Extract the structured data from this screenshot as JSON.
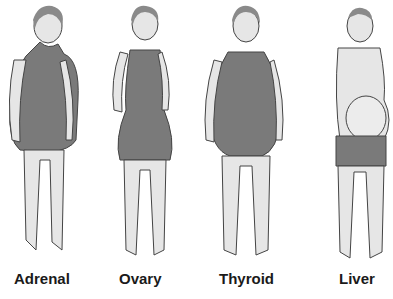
{
  "labels": [
    "Adrenal",
    "Ovary",
    "Thyroid",
    "Liver"
  ],
  "colors": {
    "skin": "#e6e6e6",
    "garment": "#7a7a7a",
    "outline": "#444444",
    "hair": "#8a8a8a"
  }
}
